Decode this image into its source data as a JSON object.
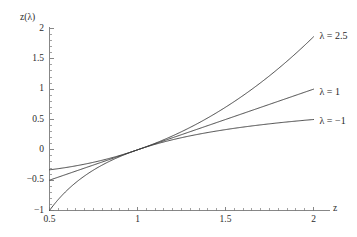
{
  "chart_data": {
    "type": "line",
    "title": "",
    "xlabel": "z",
    "ylabel": "z(λ)",
    "xlim": [
      0.5,
      2.05
    ],
    "ylim": [
      -1.05,
      2.0
    ],
    "xticks": [
      "0.5",
      "1",
      "1.5",
      "2"
    ],
    "xtick_values": [
      0.5,
      1,
      1.5,
      2
    ],
    "yticks": [
      "2",
      "1.5",
      "1",
      "0.5",
      "0",
      "-0.5",
      "-1"
    ],
    "ytick_values": [
      2,
      1.5,
      1,
      0.5,
      0,
      -0.5,
      -1
    ],
    "grid": false,
    "legend_position": "right-inline",
    "series": [
      {
        "name": "λ = 2.5",
        "lambda": 2.5,
        "color": "#3d3d3d",
        "label_x": 2.02,
        "label_y": 1.86,
        "x": [
          0.5,
          0.55,
          0.6,
          0.65,
          0.7,
          0.75,
          0.8,
          0.85,
          0.9,
          0.95,
          1.0,
          1.05,
          1.1,
          1.15,
          1.2,
          1.25,
          1.3,
          1.35,
          1.4,
          1.45,
          1.5,
          1.55,
          1.6,
          1.65,
          1.7,
          1.75,
          1.8,
          1.85,
          1.9,
          1.95,
          2.0
        ],
        "y": [
          -0.3586,
          -0.3428,
          -0.3257,
          -0.3073,
          -0.2876,
          -0.2666,
          -0.2443,
          -0.2207,
          -0.1958,
          -0.1695,
          -0.1419,
          -0.1129,
          -0.0826,
          -0.0508,
          -0.0176,
          0.0169,
          0.0529,
          0.0904,
          0.1293,
          0.1697,
          0.2115,
          0.2548,
          0.2996,
          0.3458,
          0.3936,
          0.4428,
          0.4935,
          0.5457,
          0.5995,
          0.6547,
          0.7114
        ]
      },
      {
        "name": "λ = 1",
        "lambda": 1,
        "color": "#3d3d3d",
        "label_x": 2.02,
        "label_y": 0.93,
        "x": [
          0.5,
          0.6,
          0.7,
          0.8,
          0.9,
          1.0,
          1.1,
          1.2,
          1.3,
          1.4,
          1.5,
          1.6,
          1.7,
          1.8,
          1.9,
          2.0
        ],
        "y": [
          -0.5,
          -0.4,
          -0.3,
          -0.2,
          -0.1,
          0.0,
          0.1,
          0.2,
          0.3,
          0.4,
          0.5,
          0.6,
          0.7,
          0.8,
          0.9,
          1.0
        ]
      },
      {
        "name": "λ = −1",
        "lambda": -1,
        "color": "#3d3d3d",
        "label_x": 2.02,
        "label_y": 0.46,
        "x": [
          0.5,
          0.6,
          0.7,
          0.8,
          0.9,
          1.0,
          1.1,
          1.2,
          1.3,
          1.4,
          1.5,
          1.6,
          1.7,
          1.8,
          1.9,
          2.0
        ],
        "y": [
          -1.0,
          -0.6667,
          -0.4286,
          -0.25,
          -0.1111,
          0.0,
          0.0909,
          0.1667,
          0.2308,
          0.2857,
          0.3333,
          0.375,
          0.4118,
          0.4444,
          0.4737,
          0.5
        ]
      }
    ]
  },
  "axes": {
    "x_axis_title": "z",
    "y_axis_title": "z(λ)",
    "axis_color": "#7a7a7a",
    "curve_color": "#3d3d3d"
  }
}
